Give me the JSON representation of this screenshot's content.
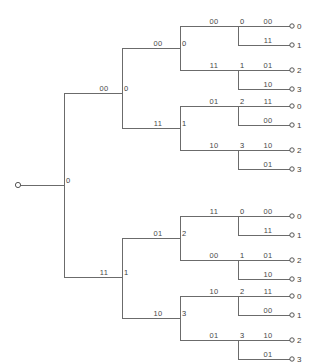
{
  "figure": {
    "background_color": "#ffffff",
    "line_color": "#6b6b6b",
    "text_color": "#3c3c3c",
    "width": 313,
    "height": 364
  },
  "root": {
    "terminal_dot": {
      "x": 18,
      "y": 185
    },
    "state_label": "0",
    "state_label_pos": {
      "x": 66,
      "y": 183
    },
    "trunk_x": 64,
    "stem": {
      "x1": 18,
      "y1": 185,
      "x2": 64,
      "y2": 185
    },
    "branch_top_y": 93,
    "branch_bottom_y": 277
  },
  "chart_data": {
    "type": "tree",
    "levels": 4,
    "leaf_count": 16,
    "branch_labels_alphabet": [
      "00",
      "01",
      "10",
      "11"
    ],
    "state_alphabet": [
      "0",
      "1",
      "2",
      "3"
    ],
    "edges": [
      {
        "level": 1,
        "label": "00",
        "from_state": "0",
        "to_state": "0"
      },
      {
        "level": 1,
        "label": "11",
        "from_state": "0",
        "to_state": "1"
      },
      {
        "level": 2,
        "label": "00",
        "from_state": "0",
        "to_state": "0"
      },
      {
        "level": 2,
        "label": "11",
        "from_state": "0",
        "to_state": "1"
      },
      {
        "level": 2,
        "label": "01",
        "from_state": "1",
        "to_state": "2"
      },
      {
        "level": 2,
        "label": "10",
        "from_state": "1",
        "to_state": "3"
      },
      {
        "level": 2,
        "label": "11",
        "from_state": "1",
        "to_state": "0"
      },
      {
        "level": 2,
        "label": "00",
        "from_state": "1",
        "to_state": "1"
      },
      {
        "level": 2,
        "label": "10",
        "from_state": "1",
        "to_state": "2"
      },
      {
        "level": 2,
        "label": "01",
        "from_state": "1",
        "to_state": "3"
      },
      {
        "level": 3,
        "label": "00",
        "to_leaf": "0"
      },
      {
        "level": 3,
        "label": "11",
        "to_leaf": "1"
      },
      {
        "level": 3,
        "label": "01",
        "to_leaf": "2"
      },
      {
        "level": 3,
        "label": "10",
        "to_leaf": "3"
      },
      {
        "level": 3,
        "label": "11",
        "to_leaf": "0"
      },
      {
        "level": 3,
        "label": "00",
        "to_leaf": "1"
      },
      {
        "level": 3,
        "label": "10",
        "to_leaf": "2"
      },
      {
        "level": 3,
        "label": "01",
        "to_leaf": "3"
      }
    ],
    "leaves": [
      "0",
      "1",
      "2",
      "3",
      "0",
      "1",
      "2",
      "3",
      "0",
      "1",
      "2",
      "3",
      "0",
      "1",
      "2",
      "3"
    ]
  },
  "level1": [
    {
      "name": "upper",
      "label": "00",
      "label_pos": {
        "x": 104,
        "y": 91
      },
      "line": {
        "x1": 64,
        "y1": 93,
        "x2": 122,
        "y2": 93
      },
      "state": "0",
      "state_pos": {
        "x": 124,
        "y": 91
      },
      "spine_x": 122,
      "spine_top": 48,
      "spine_bottom": 128
    },
    {
      "name": "lower",
      "label": "11",
      "label_pos": {
        "x": 104,
        "y": 275
      },
      "line": {
        "x1": 64,
        "y1": 277,
        "x2": 122,
        "y2": 277
      },
      "state": "1",
      "state_pos": {
        "x": 124,
        "y": 275
      },
      "spine_x": 122,
      "spine_top": 238,
      "spine_bottom": 318
    }
  ],
  "level2": [
    {
      "label": "00",
      "label_pos": {
        "x": 158,
        "y": 46
      },
      "line": {
        "x1": 122,
        "y1": 48,
        "x2": 180,
        "y2": 48
      },
      "state": "0",
      "state_pos": {
        "x": 182,
        "y": 46
      },
      "spine_x": 180,
      "spine_top": 26,
      "spine_bottom": 70
    },
    {
      "label": "11",
      "label_pos": {
        "x": 158,
        "y": 126
      },
      "line": {
        "x1": 122,
        "y1": 128,
        "x2": 180,
        "y2": 128
      },
      "state": "1",
      "state_pos": {
        "x": 182,
        "y": 126
      },
      "spine_x": 180,
      "spine_top": 106,
      "spine_bottom": 150
    },
    {
      "label": "01",
      "label_pos": {
        "x": 158,
        "y": 236
      },
      "line": {
        "x1": 122,
        "y1": 238,
        "x2": 180,
        "y2": 238
      },
      "state": "2",
      "state_pos": {
        "x": 182,
        "y": 236
      },
      "spine_x": 180,
      "spine_top": 216,
      "spine_bottom": 260
    },
    {
      "label": "10",
      "label_pos": {
        "x": 158,
        "y": 316
      },
      "line": {
        "x1": 122,
        "y1": 318,
        "x2": 180,
        "y2": 318
      },
      "state": "3",
      "state_pos": {
        "x": 182,
        "y": 316
      },
      "spine_x": 180,
      "spine_top": 296,
      "spine_bottom": 340
    }
  ],
  "level3": [
    {
      "label": "00",
      "label_pos": {
        "x": 214,
        "y": 24
      },
      "line": {
        "x1": 180,
        "y1": 26,
        "x2": 238,
        "y2": 26
      },
      "state": "0",
      "state_pos": {
        "x": 240,
        "y": 24
      },
      "spine_x": 238,
      "spine_top": 26,
      "spine_bottom": 45
    },
    {
      "label": "11",
      "label_pos": {
        "x": 214,
        "y": 68
      },
      "line": {
        "x1": 180,
        "y1": 70,
        "x2": 238,
        "y2": 70
      },
      "state": "1",
      "state_pos": {
        "x": 240,
        "y": 68
      },
      "spine_x": 238,
      "spine_top": 70,
      "spine_bottom": 89
    },
    {
      "label": "01",
      "label_pos": {
        "x": 214,
        "y": 104
      },
      "line": {
        "x1": 180,
        "y1": 106,
        "x2": 238,
        "y2": 106
      },
      "state": "2",
      "state_pos": {
        "x": 240,
        "y": 104
      },
      "spine_x": 238,
      "spine_top": 106,
      "spine_bottom": 125
    },
    {
      "label": "10",
      "label_pos": {
        "x": 214,
        "y": 148
      },
      "line": {
        "x1": 180,
        "y1": 150,
        "x2": 238,
        "y2": 150
      },
      "state": "3",
      "state_pos": {
        "x": 240,
        "y": 148
      },
      "spine_x": 238,
      "spine_top": 150,
      "spine_bottom": 169
    },
    {
      "label": "11",
      "label_pos": {
        "x": 214,
        "y": 214
      },
      "line": {
        "x1": 180,
        "y1": 216,
        "x2": 238,
        "y2": 216
      },
      "state": "0",
      "state_pos": {
        "x": 240,
        "y": 214
      },
      "spine_x": 238,
      "spine_top": 216,
      "spine_bottom": 235
    },
    {
      "label": "00",
      "label_pos": {
        "x": 214,
        "y": 258
      },
      "line": {
        "x1": 180,
        "y1": 260,
        "x2": 238,
        "y2": 260
      },
      "state": "1",
      "state_pos": {
        "x": 240,
        "y": 258
      },
      "spine_x": 238,
      "spine_top": 260,
      "spine_bottom": 279
    },
    {
      "label": "10",
      "label_pos": {
        "x": 214,
        "y": 294
      },
      "line": {
        "x1": 180,
        "y1": 296,
        "x2": 238,
        "y2": 296
      },
      "state": "2",
      "state_pos": {
        "x": 240,
        "y": 294
      },
      "spine_x": 238,
      "spine_top": 296,
      "spine_bottom": 315
    },
    {
      "label": "01",
      "label_pos": {
        "x": 214,
        "y": 338
      },
      "line": {
        "x1": 180,
        "y1": 340,
        "x2": 238,
        "y2": 340
      },
      "state": "3",
      "state_pos": {
        "x": 240,
        "y": 338
      },
      "spine_x": 238,
      "spine_top": 340,
      "spine_bottom": 359
    }
  ],
  "leaves": [
    {
      "label": "00",
      "label_pos": {
        "x": 268,
        "y": 24
      },
      "line": {
        "x1": 238,
        "y1": 26,
        "x2": 290,
        "y2": 26
      },
      "dot": {
        "x": 292,
        "y": 26
      },
      "leaf": "0",
      "leaf_pos": {
        "x": 297,
        "y": 29
      }
    },
    {
      "label": "11",
      "label_pos": {
        "x": 268,
        "y": 43
      },
      "line": {
        "x1": 238,
        "y1": 45,
        "x2": 290,
        "y2": 45
      },
      "dot": {
        "x": 292,
        "y": 45
      },
      "leaf": "1",
      "leaf_pos": {
        "x": 297,
        "y": 48
      }
    },
    {
      "label": "01",
      "label_pos": {
        "x": 268,
        "y": 68
      },
      "line": {
        "x1": 238,
        "y1": 70,
        "x2": 290,
        "y2": 70
      },
      "dot": {
        "x": 292,
        "y": 70
      },
      "leaf": "2",
      "leaf_pos": {
        "x": 297,
        "y": 73
      }
    },
    {
      "label": "10",
      "label_pos": {
        "x": 268,
        "y": 87
      },
      "line": {
        "x1": 238,
        "y1": 89,
        "x2": 290,
        "y2": 89
      },
      "dot": {
        "x": 292,
        "y": 89
      },
      "leaf": "3",
      "leaf_pos": {
        "x": 297,
        "y": 92
      }
    },
    {
      "label": "11",
      "label_pos": {
        "x": 268,
        "y": 104
      },
      "line": {
        "x1": 238,
        "y1": 106,
        "x2": 290,
        "y2": 106
      },
      "dot": {
        "x": 292,
        "y": 106
      },
      "leaf": "0",
      "leaf_pos": {
        "x": 297,
        "y": 109
      }
    },
    {
      "label": "00",
      "label_pos": {
        "x": 268,
        "y": 123
      },
      "line": {
        "x1": 238,
        "y1": 125,
        "x2": 290,
        "y2": 125
      },
      "dot": {
        "x": 292,
        "y": 125
      },
      "leaf": "1",
      "leaf_pos": {
        "x": 297,
        "y": 128
      }
    },
    {
      "label": "10",
      "label_pos": {
        "x": 268,
        "y": 148
      },
      "line": {
        "x1": 238,
        "y1": 150,
        "x2": 290,
        "y2": 150
      },
      "dot": {
        "x": 292,
        "y": 150
      },
      "leaf": "2",
      "leaf_pos": {
        "x": 297,
        "y": 153
      }
    },
    {
      "label": "01",
      "label_pos": {
        "x": 268,
        "y": 167
      },
      "line": {
        "x1": 238,
        "y1": 169,
        "x2": 290,
        "y2": 169
      },
      "dot": {
        "x": 292,
        "y": 169
      },
      "leaf": "3",
      "leaf_pos": {
        "x": 297,
        "y": 172
      }
    },
    {
      "label": "00",
      "label_pos": {
        "x": 268,
        "y": 214
      },
      "line": {
        "x1": 238,
        "y1": 216,
        "x2": 290,
        "y2": 216
      },
      "dot": {
        "x": 292,
        "y": 216
      },
      "leaf": "0",
      "leaf_pos": {
        "x": 297,
        "y": 219
      }
    },
    {
      "label": "11",
      "label_pos": {
        "x": 268,
        "y": 233
      },
      "line": {
        "x1": 238,
        "y1": 235,
        "x2": 290,
        "y2": 235
      },
      "dot": {
        "x": 292,
        "y": 235
      },
      "leaf": "1",
      "leaf_pos": {
        "x": 297,
        "y": 238
      }
    },
    {
      "label": "01",
      "label_pos": {
        "x": 268,
        "y": 258
      },
      "line": {
        "x1": 238,
        "y1": 260,
        "x2": 290,
        "y2": 260
      },
      "dot": {
        "x": 292,
        "y": 260
      },
      "leaf": "2",
      "leaf_pos": {
        "x": 297,
        "y": 263
      }
    },
    {
      "label": "10",
      "label_pos": {
        "x": 268,
        "y": 277
      },
      "line": {
        "x1": 238,
        "y1": 279,
        "x2": 290,
        "y2": 279
      },
      "dot": {
        "x": 292,
        "y": 279
      },
      "leaf": "3",
      "leaf_pos": {
        "x": 297,
        "y": 282
      }
    },
    {
      "label": "11",
      "label_pos": {
        "x": 268,
        "y": 294
      },
      "line": {
        "x1": 238,
        "y1": 296,
        "x2": 290,
        "y2": 296
      },
      "dot": {
        "x": 292,
        "y": 296
      },
      "leaf": "0",
      "leaf_pos": {
        "x": 297,
        "y": 299
      }
    },
    {
      "label": "00",
      "label_pos": {
        "x": 268,
        "y": 313
      },
      "line": {
        "x1": 238,
        "y1": 315,
        "x2": 290,
        "y2": 315
      },
      "dot": {
        "x": 292,
        "y": 315
      },
      "leaf": "1",
      "leaf_pos": {
        "x": 297,
        "y": 318
      }
    },
    {
      "label": "10",
      "label_pos": {
        "x": 268,
        "y": 338
      },
      "line": {
        "x1": 238,
        "y1": 340,
        "x2": 290,
        "y2": 340
      },
      "dot": {
        "x": 292,
        "y": 340
      },
      "leaf": "2",
      "leaf_pos": {
        "x": 297,
        "y": 343
      }
    },
    {
      "label": "01",
      "label_pos": {
        "x": 268,
        "y": 357
      },
      "line": {
        "x1": 238,
        "y1": 359,
        "x2": 290,
        "y2": 359
      },
      "dot": {
        "x": 292,
        "y": 359
      },
      "leaf": "3",
      "leaf_pos": {
        "x": 297,
        "y": 362
      }
    }
  ]
}
